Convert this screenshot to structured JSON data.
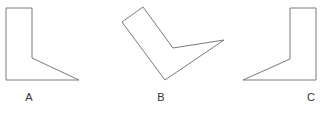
{
  "diagram": {
    "stroke_color": "#7a7a7a",
    "shapes": [
      {
        "label": "A",
        "points": "6,8 32,8 32,58 79,80 6,80",
        "label_x": 29,
        "label_y": 92
      },
      {
        "label": "B",
        "points": "122,22 143,7 173,48 224,40 165,80",
        "label_x": 161,
        "label_y": 92
      },
      {
        "label": "C",
        "points": "290,8 316,8 316,80 243,80 290,59",
        "label_x": 311,
        "label_y": 92
      }
    ]
  }
}
